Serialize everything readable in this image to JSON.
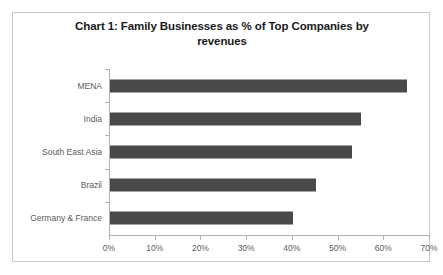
{
  "chart_data": {
    "type": "bar",
    "orientation": "horizontal",
    "title": "Chart 1: Family Businesses as % of Top Companies by revenues",
    "title_line1": "Chart 1: Family Businesses as % of Top Companies by",
    "title_line2": "revenues",
    "categories": [
      "MENA",
      "India",
      "South East Asia",
      "Brazil",
      "Germany & France"
    ],
    "values": [
      65,
      55,
      53,
      45,
      40
    ],
    "xlabel": "",
    "ylabel": "",
    "xlim": [
      0,
      70
    ],
    "xticks": [
      0,
      10,
      20,
      30,
      40,
      50,
      60,
      70
    ],
    "xtick_labels": [
      "0%",
      "10%",
      "20%",
      "30%",
      "40%",
      "50%",
      "60%",
      "70%"
    ],
    "grid": false,
    "legend": false,
    "bar_color": "#494949",
    "axis_color": "#b0b0b0",
    "label_color": "#5c5c5c",
    "title_color": "#1a1a1a",
    "frame_color": "#c9c9c9",
    "background": "#ffffff"
  }
}
